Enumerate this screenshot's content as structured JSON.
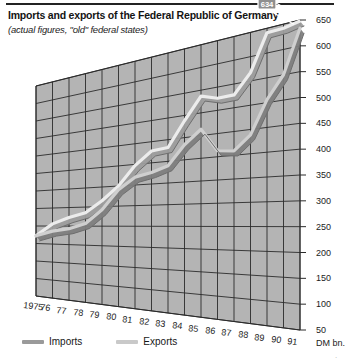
{
  "chart_data": {
    "type": "line",
    "title": "Imports and exports of the Federal Republic of Germany",
    "subtitle": "(actual figures, \"old\" federal states)",
    "xlabel": "",
    "ylabel": "DM bn.",
    "y_unit": "DM bn.",
    "ylim": [
      50,
      650
    ],
    "ytick_step": 50,
    "yticks": [
      650,
      600,
      550,
      500,
      450,
      400,
      350,
      300,
      250,
      200,
      150,
      100,
      50
    ],
    "categories": [
      "1975",
      "76",
      "77",
      "78",
      "79",
      "80",
      "81",
      "82",
      "83",
      "84",
      "85",
      "86",
      "87",
      "88",
      "89",
      "90",
      "91"
    ],
    "x": [
      1975,
      1976,
      1977,
      1978,
      1979,
      1980,
      1981,
      1982,
      1983,
      1984,
      1985,
      1986,
      1987,
      1988,
      1989,
      1990,
      1991
    ],
    "grid": true,
    "legend_position": "bottom-left",
    "projection": "3d-perspective-ribbon",
    "series": [
      {
        "name": "Imports",
        "color": "#9a9a9a",
        "end_label": "634",
        "values": [
          222,
          236,
          243,
          257,
          292,
          341,
          369,
          377,
          390,
          434,
          464,
          413,
          409,
          439,
          506,
          550,
          634
        ]
      },
      {
        "name": "Exports",
        "color": "#d7d7d7",
        "end_label": "648",
        "values": [
          222,
          256,
          273,
          285,
          315,
          350,
          397,
          428,
          432,
          488,
          537,
          526,
          527,
          567,
          641,
          642,
          648
        ]
      }
    ],
    "annotations": [
      {
        "text": "648",
        "series": "Exports",
        "at": "1991"
      },
      {
        "text": "634",
        "series": "Imports",
        "at": "1991"
      }
    ]
  },
  "legend": {
    "items": [
      {
        "label": "Imports",
        "color": "#9a9a9a"
      },
      {
        "label": "Exports",
        "color": "#c9c9c9"
      }
    ]
  },
  "colors": {
    "plot_fill": "#b4b4b4",
    "grid_line": "#2b2b2b",
    "imports": "#9a9a9a",
    "exports": "#dcdcdc",
    "rule": "#232323"
  }
}
